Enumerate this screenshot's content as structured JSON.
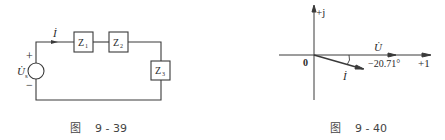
{
  "figures": [
    {
      "id": "circuit",
      "caption": "图    9 - 39",
      "source": {
        "label": "U̇",
        "subscript": "s",
        "plus": "+",
        "minus": "−"
      },
      "current": {
        "label": "İ"
      },
      "impedances": [
        {
          "label": "Z",
          "subscript": "1"
        },
        {
          "label": "Z",
          "subscript": "2"
        },
        {
          "label": "Z",
          "subscript": "3"
        }
      ]
    },
    {
      "id": "phasor",
      "caption": "图    9 - 40",
      "axes": {
        "imag_label": "+j",
        "real_label": "+1",
        "origin_label": "0"
      },
      "voltage_phasor": {
        "label": "U̇",
        "angle_deg": 0
      },
      "current_phasor": {
        "label": "İ",
        "angle_deg": -20.71
      },
      "angle_label": "−20.71°"
    }
  ],
  "colors": {
    "line": "#3a3a3a",
    "text": "#2a2a2a",
    "background": "#ffffff"
  }
}
